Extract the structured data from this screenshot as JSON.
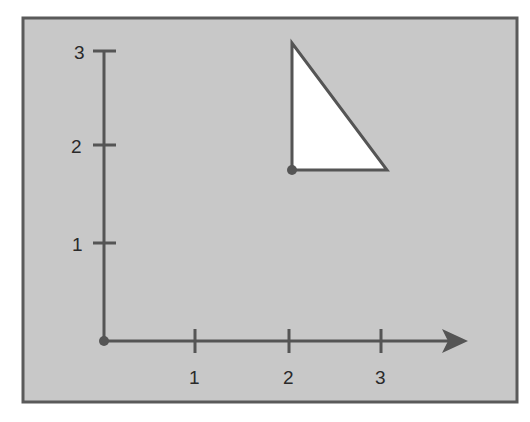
{
  "diagram": {
    "background_color": "#c8c8c8",
    "frame_color": "#5a5a5a",
    "axis_color": "#555555",
    "shape_fill": "#ffffff",
    "shape_stroke": "#555555",
    "x_axis": {
      "ticks": [
        {
          "value": 1,
          "label": "1"
        },
        {
          "value": 2,
          "label": "2"
        },
        {
          "value": 3,
          "label": "3"
        }
      ],
      "has_arrow": true
    },
    "y_axis": {
      "ticks": [
        {
          "value": 1,
          "label": "1"
        },
        {
          "value": 2,
          "label": "2"
        },
        {
          "value": 3,
          "label": "3"
        }
      ],
      "has_arrow": false
    },
    "origin_point": {
      "x": 0,
      "y": 0
    },
    "triangle": {
      "vertices": [
        {
          "x": 2,
          "y": 3.1
        },
        {
          "x": 2,
          "y": 1.75
        },
        {
          "x": 3,
          "y": 1.75
        }
      ],
      "marked_vertex": {
        "x": 2,
        "y": 1.75
      }
    }
  }
}
